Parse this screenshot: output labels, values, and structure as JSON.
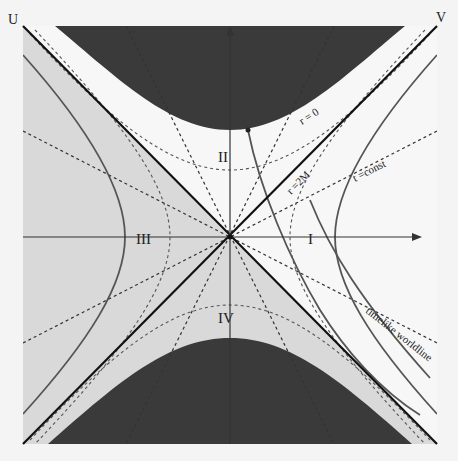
{
  "diagram": {
    "axis_labels": {
      "u": "U",
      "v": "V"
    },
    "regions": [
      {
        "id": "I",
        "label": "I"
      },
      {
        "id": "II",
        "label": "II"
      },
      {
        "id": "III",
        "label": "III"
      },
      {
        "id": "IV",
        "label": "IV"
      }
    ],
    "annotations": {
      "singularity": "r = 0",
      "horizon": "r =2M",
      "t_const": "t =const",
      "worldline": "timelike worldline"
    },
    "colors": {
      "background": "#f4f4f4",
      "exterior_region": "#f7f7f7",
      "shaded_region": "#d9d9d9",
      "singularity_fill": "#3a3a3a",
      "horizon_line": "#111111",
      "curve": "#555555",
      "dashed": "#333333"
    }
  }
}
